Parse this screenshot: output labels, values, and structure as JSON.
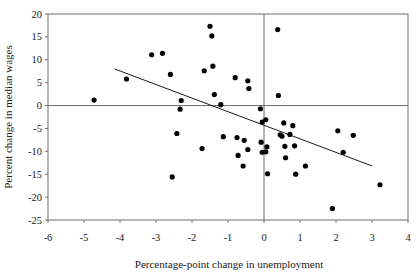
{
  "chart_data": {
    "type": "scatter",
    "title": "",
    "xlabel": "Percentage-point change in unemployment",
    "ylabel": "Percent change in median wages",
    "xlim": [
      -6,
      4
    ],
    "ylim": [
      -25,
      20
    ],
    "xticks": [
      "-6",
      "-5",
      "-4",
      "-3",
      "-2",
      "-1",
      "0",
      "1",
      "2",
      "3",
      "4"
    ],
    "xtick_values": [
      -6,
      -5,
      -4,
      -3,
      -2,
      -1,
      0,
      1,
      2,
      3,
      4
    ],
    "yticks": [
      "20",
      "15",
      "10",
      "5",
      "0",
      "-5",
      "-10",
      "-15",
      "-20",
      "-25"
    ],
    "ytick_values": [
      20,
      15,
      10,
      5,
      0,
      -5,
      -10,
      -15,
      -20,
      -25
    ],
    "grid": false,
    "legend": null,
    "zero_lines": {
      "x": 0,
      "y": 0
    },
    "marker": {
      "shape": "circle",
      "radius": 2.6,
      "color": "#000000"
    },
    "trendline": {
      "type": "linear",
      "x_start": -4.15,
      "y_start": 8.0,
      "x_end": 3.0,
      "y_end": -13.2,
      "color": "#1a1a1a"
    },
    "points": [
      [
        -4.72,
        1.2
      ],
      [
        -3.82,
        5.8
      ],
      [
        -3.12,
        11.1
      ],
      [
        -2.82,
        11.4
      ],
      [
        -2.6,
        6.8
      ],
      [
        -2.55,
        -15.6
      ],
      [
        -2.42,
        -6.1
      ],
      [
        -2.33,
        -0.8
      ],
      [
        -2.3,
        1.1
      ],
      [
        -1.72,
        -9.4
      ],
      [
        -1.66,
        7.6
      ],
      [
        -1.5,
        17.3
      ],
      [
        -1.45,
        15.2
      ],
      [
        -1.42,
        8.6
      ],
      [
        -1.38,
        2.4
      ],
      [
        -1.2,
        0.2
      ],
      [
        -1.13,
        -6.8
      ],
      [
        -0.8,
        6.1
      ],
      [
        -0.75,
        -7.0
      ],
      [
        -0.72,
        -10.9
      ],
      [
        -0.58,
        -13.2
      ],
      [
        -0.55,
        -7.6
      ],
      [
        -0.45,
        5.4
      ],
      [
        -0.42,
        3.7
      ],
      [
        -0.45,
        -9.6
      ],
      [
        -0.1,
        -0.7
      ],
      [
        -0.08,
        -8.0
      ],
      [
        -0.05,
        -10.2
      ],
      [
        -0.05,
        -3.6
      ],
      [
        0.05,
        -3.1
      ],
      [
        0.05,
        -10.1
      ],
      [
        0.08,
        -9.0
      ],
      [
        0.1,
        -14.9
      ],
      [
        0.38,
        16.6
      ],
      [
        0.4,
        2.2
      ],
      [
        0.45,
        -6.4
      ],
      [
        0.5,
        -6.7
      ],
      [
        0.55,
        -3.8
      ],
      [
        0.58,
        -8.9
      ],
      [
        0.6,
        -11.4
      ],
      [
        0.72,
        -6.3
      ],
      [
        0.8,
        -4.4
      ],
      [
        0.85,
        -8.8
      ],
      [
        0.88,
        -15.0
      ],
      [
        1.15,
        -13.2
      ],
      [
        1.9,
        -22.5
      ],
      [
        2.05,
        -5.5
      ],
      [
        2.2,
        -10.2
      ],
      [
        2.48,
        -6.5
      ],
      [
        3.22,
        -17.3
      ]
    ]
  }
}
